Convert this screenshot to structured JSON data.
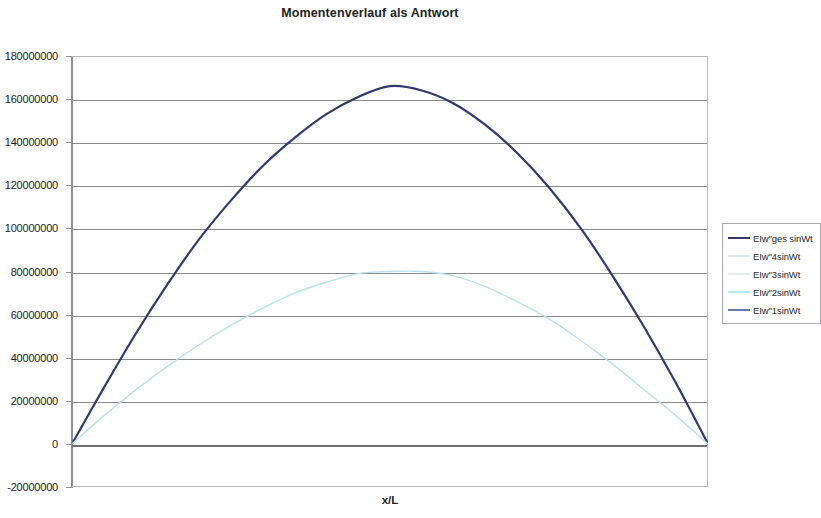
{
  "chart_data": {
    "type": "line",
    "title": "Momentenverlauf als Antwort",
    "xlabel": "x/L",
    "ylabel": "",
    "grid": true,
    "legend_position": "right",
    "ylim": [
      -20000000,
      180000000
    ],
    "ytick_labels": [
      "180000000",
      "160000000",
      "140000000",
      "120000000",
      "100000000",
      "80000000",
      "60000000",
      "40000000",
      "20000000",
      "0",
      "-20000000"
    ],
    "ytick_values": [
      180000000,
      160000000,
      140000000,
      120000000,
      100000000,
      80000000,
      60000000,
      40000000,
      20000000,
      0,
      -20000000
    ],
    "xlim": [
      0,
      1
    ],
    "xtick_labels": [],
    "series": [
      {
        "name": "EIw\"ges sinWt",
        "color": "#2f3a6e",
        "width": 2.2,
        "x": [
          0,
          0.05,
          0.1,
          0.15,
          0.2,
          0.25,
          0.3,
          0.35,
          0.4,
          0.45,
          0.5,
          0.55,
          0.6,
          0.65,
          0.7,
          0.75,
          0.8,
          0.85,
          0.9,
          0.95,
          1
        ],
        "values": [
          0,
          26000000,
          51000000,
          74000000,
          95000000,
          113000000,
          129000000,
          142000000,
          153000000,
          161000000,
          166000000,
          164000000,
          158000000,
          148000000,
          135000000,
          119000000,
          100000000,
          78000000,
          54000000,
          28000000,
          0
        ]
      },
      {
        "name": "EIw\"4sinWt",
        "color": "#d8e9ef",
        "width": 1,
        "x": [],
        "values": []
      },
      {
        "name": "EIw\"3sinWt",
        "color": "#e3eef3",
        "width": 1,
        "x": [],
        "values": []
      },
      {
        "name": "EIw\"2sinWt",
        "color": "#b7e2ef",
        "width": 1.4,
        "x": [
          0,
          0.05,
          0.1,
          0.15,
          0.2,
          0.25,
          0.3,
          0.35,
          0.4,
          0.45,
          0.5,
          0.55,
          0.6,
          0.65,
          0.7,
          0.75,
          0.8,
          0.85,
          0.9,
          0.95,
          1
        ],
        "values": [
          0,
          13000000,
          25000000,
          36000000,
          46000000,
          55000000,
          63000000,
          70000000,
          75000000,
          79000000,
          80000000,
          80000000,
          78000000,
          73000000,
          66000000,
          58000000,
          48000000,
          37000000,
          25000000,
          13000000,
          0
        ]
      },
      {
        "name": "EIw\"1sinWt",
        "color": "#6976b4",
        "width": 1.4,
        "x": [],
        "values": []
      }
    ]
  },
  "legend": {
    "entries": [
      {
        "label": "EIw\"ges sinWt"
      },
      {
        "label": "EIw\"4sinWt"
      },
      {
        "label": "EIw\"3sinWt"
      },
      {
        "label": "EIw\"2sinWt"
      },
      {
        "label": "EIw\"1sinWt"
      }
    ]
  }
}
